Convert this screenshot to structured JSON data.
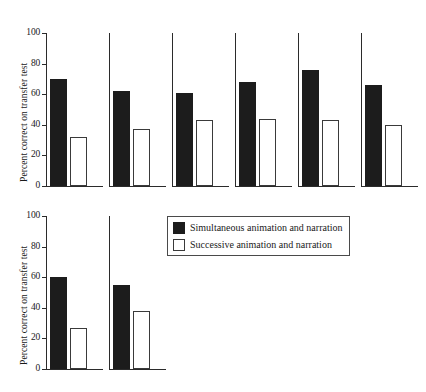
{
  "chart_data": {
    "type": "bar",
    "title": "",
    "xlabel": "",
    "ylabel": "Percent correct on transfer test",
    "ylim": [
      0,
      100
    ],
    "yticks": [
      0,
      20,
      40,
      60,
      80,
      100
    ],
    "grid": false,
    "legend_position": "center",
    "series": [
      {
        "name": "Simultaneous animation and narration",
        "style": "filled",
        "values": [
          70,
          62,
          61,
          68,
          76,
          66,
          60,
          55
        ]
      },
      {
        "name": "Successive animation and narration",
        "style": "hollow",
        "values": [
          32,
          37,
          43,
          44,
          43,
          40,
          27,
          38
        ]
      }
    ],
    "panels": [
      {
        "index": 1,
        "row": 1,
        "simultaneous": 70,
        "successive": 32
      },
      {
        "index": 2,
        "row": 1,
        "simultaneous": 62,
        "successive": 37
      },
      {
        "index": 3,
        "row": 1,
        "simultaneous": 61,
        "successive": 43
      },
      {
        "index": 4,
        "row": 1,
        "simultaneous": 68,
        "successive": 44
      },
      {
        "index": 5,
        "row": 1,
        "simultaneous": 76,
        "successive": 43
      },
      {
        "index": 6,
        "row": 1,
        "simultaneous": 66,
        "successive": 40
      },
      {
        "index": 7,
        "row": 2,
        "simultaneous": 60,
        "successive": 27
      },
      {
        "index": 8,
        "row": 2,
        "simultaneous": 55,
        "successive": 38
      }
    ]
  },
  "axes": {
    "row1": {
      "ylabel": "Percent correct on transfer test",
      "ticklabels": [
        "100",
        "80",
        "60",
        "40",
        "20",
        "0"
      ]
    },
    "row2": {
      "ylabel": "Percent correct on transfer test",
      "ticklabels": [
        "100",
        "80",
        "60",
        "40",
        "20",
        "0"
      ]
    }
  },
  "legend": {
    "items": [
      {
        "label": "Simultaneous animation and narration",
        "swatch": "filled"
      },
      {
        "label": "Successive animation and narration",
        "swatch": "hollow"
      }
    ]
  }
}
